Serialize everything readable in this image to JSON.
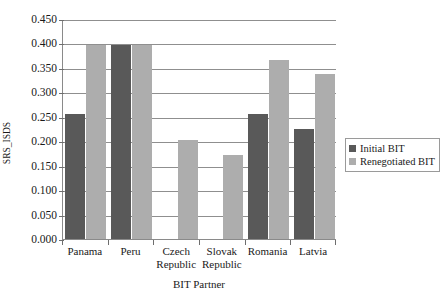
{
  "chart_data": {
    "type": "bar",
    "title": "",
    "xlabel": "BIT Partner",
    "ylabel": "SRS_ISDS",
    "categories": [
      "Panama",
      "Peru",
      "Czech\nRepublic",
      "Slovak\nRepublic",
      "Romania",
      "Latvia"
    ],
    "series": [
      {
        "name": "Initial BIT",
        "values": [
          0.256,
          0.397,
          null,
          null,
          0.255,
          0.226
        ]
      },
      {
        "name": "Renegotiated BIT",
        "values": [
          0.396,
          0.396,
          0.202,
          0.172,
          0.366,
          0.338
        ]
      }
    ],
    "ylim": [
      0.0,
      0.45
    ],
    "y_ticks": [
      "0.000",
      "0.050",
      "0.100",
      "0.150",
      "0.200",
      "0.250",
      "0.300",
      "0.350",
      "0.400",
      "0.450"
    ],
    "y_tick_values": [
      0.0,
      0.05,
      0.1,
      0.15,
      0.2,
      0.25,
      0.3,
      0.35,
      0.4,
      0.45
    ],
    "grid": true,
    "legend_position": "right"
  },
  "legend": {
    "entries": [
      {
        "label": "Initial BIT",
        "color": "#595959"
      },
      {
        "label": "Renegotiated BIT",
        "color": "#adadad"
      }
    ]
  },
  "colors": {
    "initial_bit": "#595959",
    "renegotiated_bit": "#adadad",
    "axis": "#8a8a8a",
    "gridline": "#8f8f8f",
    "background": "#ffffff"
  }
}
